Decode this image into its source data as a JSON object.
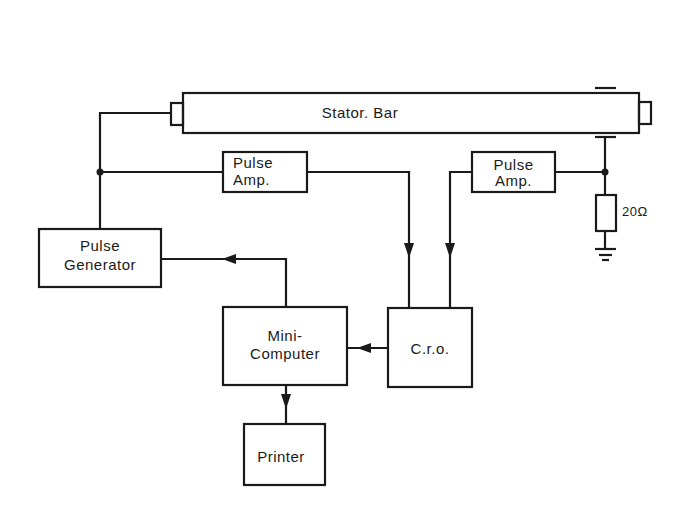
{
  "diagram": {
    "blocks": {
      "stator_bar": "Stator. Bar",
      "pulse_amp_left_l1": "Pulse",
      "pulse_amp_left_l2": "Amp.",
      "pulse_amp_right_l1": "Pulse",
      "pulse_amp_right_l2": "Amp.",
      "pulse_generator_l1": "Pulse",
      "pulse_generator_l2": "Generator",
      "mini_computer_l1": "Mini-",
      "mini_computer_l2": "Computer",
      "cro": "C.r.o.",
      "printer": "Printer"
    },
    "resistor_label": "20Ω",
    "colors": {
      "ink": "#1a1a1a",
      "background": "#ffffff"
    }
  }
}
